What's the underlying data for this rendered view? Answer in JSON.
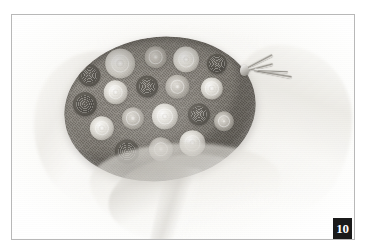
{
  "page": {
    "background_color": "#ffffff"
  },
  "plate": {
    "frame_color": "#b8b8b8",
    "figure_number": "10",
    "badge_background": "#1a1a1a",
    "badge_text_color": "#ffffff"
  },
  "photo": {
    "subject": "round woven bowl filled with rosette flowers wrapped in tissue paper",
    "palette": {
      "paper_white": "#fcfcfc",
      "tissue_gray": "#e6e4de",
      "bowl_dark": "#6d6861",
      "bowl_mid": "#8d8880",
      "rosette_light": "#f3f1eb",
      "rosette_dark": "#56524a",
      "metal_clip": "#d6d4ce"
    },
    "rosettes": [
      {
        "x": 30,
        "y": 30,
        "size": 22,
        "tone": "dark",
        "spiral": true
      },
      {
        "x": 62,
        "y": 22,
        "size": 30,
        "tone": "light",
        "spiral": false
      },
      {
        "x": 98,
        "y": 20,
        "size": 22,
        "tone": "mid",
        "spiral": false
      },
      {
        "x": 128,
        "y": 26,
        "size": 26,
        "tone": "light",
        "spiral": false
      },
      {
        "x": 158,
        "y": 34,
        "size": 20,
        "tone": "dark",
        "spiral": true
      },
      {
        "x": 22,
        "y": 58,
        "size": 24,
        "tone": "dark",
        "spiral": true
      },
      {
        "x": 54,
        "y": 50,
        "size": 24,
        "tone": "light",
        "spiral": false
      },
      {
        "x": 86,
        "y": 48,
        "size": 22,
        "tone": "dark",
        "spiral": true
      },
      {
        "x": 116,
        "y": 52,
        "size": 24,
        "tone": "mid",
        "spiral": false
      },
      {
        "x": 150,
        "y": 58,
        "size": 22,
        "tone": "light",
        "spiral": false
      },
      {
        "x": 36,
        "y": 84,
        "size": 24,
        "tone": "light",
        "spiral": false
      },
      {
        "x": 68,
        "y": 78,
        "size": 22,
        "tone": "mid",
        "spiral": false
      },
      {
        "x": 100,
        "y": 80,
        "size": 26,
        "tone": "light",
        "spiral": false
      },
      {
        "x": 134,
        "y": 82,
        "size": 22,
        "tone": "dark",
        "spiral": true
      },
      {
        "x": 58,
        "y": 110,
        "size": 24,
        "tone": "dark",
        "spiral": true
      },
      {
        "x": 92,
        "y": 112,
        "size": 24,
        "tone": "mid",
        "spiral": false
      },
      {
        "x": 124,
        "y": 110,
        "size": 26,
        "tone": "light",
        "spiral": false
      },
      {
        "x": 158,
        "y": 92,
        "size": 20,
        "tone": "mid",
        "spiral": false
      }
    ]
  }
}
